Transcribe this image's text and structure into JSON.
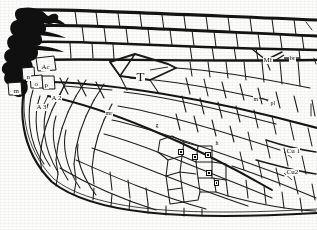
{
  "figure": {
    "type": "scientific-line-illustration",
    "background_color": "#fdfdfb",
    "ink_color": "#111111"
  },
  "labels": [
    {
      "id": "ac",
      "text": "Ac",
      "x": 41,
      "y": 64,
      "size": "md",
      "note": "arculus / basal cell label"
    },
    {
      "id": "n",
      "text": "n",
      "x": 26,
      "y": 74,
      "size": "md",
      "note": "basal cell n"
    },
    {
      "id": "o",
      "text": "o",
      "x": 34,
      "y": 81,
      "size": "md",
      "note": "basal cell o"
    },
    {
      "id": "p",
      "text": "p",
      "x": 44,
      "y": 82,
      "size": "md",
      "note": "basal cell p"
    },
    {
      "id": "m",
      "text": "m",
      "x": 13,
      "y": 88,
      "size": "md",
      "note": "basal cell m"
    },
    {
      "id": "a2",
      "text": "A 2",
      "x": 51,
      "y": 95,
      "size": "md",
      "note": "second anal vein"
    },
    {
      "id": "a3",
      "text": "A 3",
      "x": 36,
      "y": 104,
      "size": "md",
      "note": "third anal vein"
    },
    {
      "id": "t",
      "text": "T",
      "x": 136,
      "y": 70,
      "size": "lg",
      "note": "triangle cell"
    },
    {
      "id": "mr",
      "text": "mr",
      "x": 105,
      "y": 110,
      "size": "sm",
      "note": "median cell mr"
    },
    {
      "id": "g",
      "text": "g",
      "x": 155,
      "y": 122,
      "size": "sm",
      "note": "cell g"
    },
    {
      "id": "h",
      "text": "h",
      "x": 215,
      "y": 140,
      "size": "sm",
      "note": "cell h"
    },
    {
      "id": "mr2",
      "text": "m",
      "x": 253,
      "y": 96,
      "size": "sm",
      "note": "cell m (distal)"
    },
    {
      "id": "pl",
      "text": "pl",
      "x": 270,
      "y": 100,
      "size": "sm",
      "note": "cell pl"
    },
    {
      "id": "mf",
      "text": "Mf",
      "x": 263,
      "y": 57,
      "size": "md",
      "note": "median forking"
    },
    {
      "id": "br",
      "text": "br",
      "x": 289,
      "y": 55,
      "size": "md",
      "note": "brace / bridge vein"
    },
    {
      "id": "cu1",
      "text": "Cu 1",
      "x": 286,
      "y": 148,
      "size": "md",
      "note": "first cubital vein"
    },
    {
      "id": "cu2",
      "text": "Cu2",
      "x": 286,
      "y": 169,
      "size": "md",
      "note": "second cubital vein"
    }
  ],
  "cell_markers": [
    {
      "id": "marker-1",
      "x": 178,
      "y": 149,
      "w": 6,
      "h": 6
    },
    {
      "id": "marker-2",
      "x": 192,
      "y": 154,
      "w": 6,
      "h": 6
    },
    {
      "id": "marker-3",
      "x": 205,
      "y": 152,
      "w": 6,
      "h": 6
    },
    {
      "id": "marker-4",
      "x": 206,
      "y": 170,
      "w": 6,
      "h": 6
    },
    {
      "id": "marker-5",
      "x": 214,
      "y": 180,
      "w": 5,
      "h": 6
    }
  ],
  "leader_lines": [
    {
      "id": "leader-br",
      "x1": 284,
      "y1": 58,
      "x2": 300,
      "y2": 58
    },
    {
      "id": "leader-mf",
      "x1": 272,
      "y1": 57,
      "x2": 281,
      "y2": 53
    }
  ]
}
